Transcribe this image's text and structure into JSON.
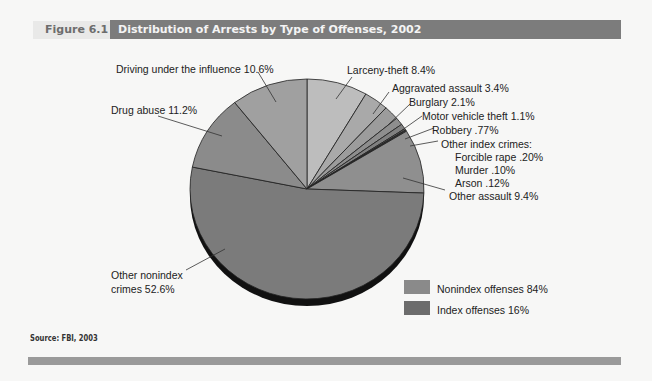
{
  "figure": {
    "label": "Figure 6.1",
    "title": "Distribution of Arrests by Type of Offenses, 2002",
    "source": "Source: FBI, 2003"
  },
  "colors": {
    "title_bar": "#7c7c7c",
    "label_box": "#e9e9e8",
    "bottom_bar": "#9a9a9a",
    "nonindex": "#8a8a8a",
    "index": "#6c6c6c"
  },
  "labels": {
    "dui": "Driving under the influence 10.6%",
    "larceny": "Larceny-theft 8.4%",
    "agg_assault": "Aggravated assault 3.4%",
    "burglary": "Burglary 2.1%",
    "mvt": "Motor vehicle theft 1.1%",
    "robbery": "Robbery .77%",
    "other_index_header": "Other index crimes:",
    "forcible_rape": "Forcible rape .20%",
    "murder": "Murder .10%",
    "arson": "Arson .12%",
    "other_assault": "Other assault 9.4%",
    "drug_abuse": "Drug abuse 11.2%",
    "other_nonindex_1": "Other nonindex",
    "other_nonindex_2": "crimes 52.6%"
  },
  "legend": [
    {
      "label": "Nonindex offenses 84%",
      "color": "#8a8a8a"
    },
    {
      "label": "Index offenses 16%",
      "color": "#6c6c6c"
    }
  ],
  "chart_data": {
    "type": "pie",
    "title": "Distribution of Arrests by Type of Offenses, 2002",
    "start_angle_deg": 0,
    "direction": "clockwise",
    "slices": [
      {
        "name": "Larceny-theft",
        "value": 8.4,
        "group": "Index",
        "color": "#bdbdbd"
      },
      {
        "name": "Aggravated assault",
        "value": 3.4,
        "group": "Index",
        "color": "#a9a9a9"
      },
      {
        "name": "Burglary",
        "value": 2.1,
        "group": "Index",
        "color": "#9c9c9c"
      },
      {
        "name": "Motor vehicle theft",
        "value": 1.1,
        "group": "Index",
        "color": "#8e8e8e"
      },
      {
        "name": "Robbery",
        "value": 0.77,
        "group": "Index",
        "color": "#808080"
      },
      {
        "name": "Forcible rape",
        "value": 0.2,
        "group": "Index",
        "color": "#747474"
      },
      {
        "name": "Murder",
        "value": 0.1,
        "group": "Index",
        "color": "#6a6a6a"
      },
      {
        "name": "Arson",
        "value": 0.12,
        "group": "Index",
        "color": "#7a7a7a"
      },
      {
        "name": "Other assault",
        "value": 9.4,
        "group": "Nonindex",
        "color": "#8f8f8f"
      },
      {
        "name": "Other nonindex crimes",
        "value": 52.6,
        "group": "Nonindex",
        "color": "#7b7b7b"
      },
      {
        "name": "Drug abuse",
        "value": 11.2,
        "group": "Nonindex",
        "color": "#8b8b8b"
      },
      {
        "name": "Driving under the influence",
        "value": 10.6,
        "group": "Nonindex",
        "color": "#a0a0a0"
      }
    ],
    "groups": [
      {
        "name": "Nonindex offenses",
        "value": 84
      },
      {
        "name": "Index offenses",
        "value": 16
      }
    ],
    "legend_position": "bottom-right"
  }
}
